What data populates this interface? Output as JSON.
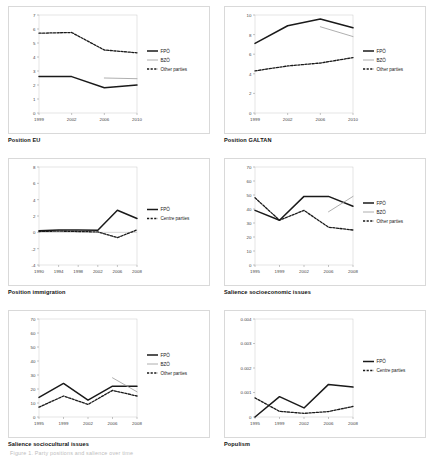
{
  "figure": {
    "footer_note": "Figure 1. Party positions and salience over time",
    "panel_layout": "2 columns × 3 rows"
  },
  "legend_labels": {
    "fpo": "FPÖ",
    "bzo": "BZÖ",
    "other": "Other parties",
    "centre": "Centre parties"
  },
  "captions": [
    "Position EU",
    "Position GALTAN",
    "Position immigration",
    "Salience socioeconomic issues",
    "Salience sociocultural issues",
    "Populism"
  ],
  "chart_data": [
    {
      "type": "line",
      "title": "Position EU",
      "xlabel": "",
      "ylabel": "",
      "x": [
        1999,
        2002,
        2006,
        2010
      ],
      "xtick_labels": [
        "1999",
        "2002",
        "2006",
        "2010"
      ],
      "ylim": [
        0,
        7
      ],
      "ytick_labels": [
        "0",
        "1",
        "2",
        "3",
        "4",
        "5",
        "6",
        "7"
      ],
      "grid": false,
      "legend_position": "right",
      "series": [
        {
          "name": "FPÖ",
          "style": "solid-thick",
          "color": "#1a1a1a",
          "x": [
            1999,
            2002,
            2006,
            2010
          ],
          "values": [
            2.6,
            2.6,
            1.8,
            2.0
          ]
        },
        {
          "name": "BZÖ",
          "style": "solid-thin",
          "color": "#9a9a9a",
          "x": [
            2006,
            2010
          ],
          "values": [
            2.5,
            2.45
          ]
        },
        {
          "name": "Other parties",
          "style": "dashed",
          "color": "#1a1a1a",
          "x": [
            1999,
            2002,
            2006,
            2010
          ],
          "values": [
            5.7,
            5.75,
            4.5,
            4.3
          ]
        }
      ]
    },
    {
      "type": "line",
      "title": "Position GALTAN",
      "xlabel": "",
      "ylabel": "",
      "x": [
        1999,
        2002,
        2006,
        2010
      ],
      "xtick_labels": [
        "1999",
        "2002",
        "2006",
        "2010"
      ],
      "ylim": [
        0,
        10
      ],
      "ytick_labels": [
        "0",
        "2",
        "4",
        "6",
        "8",
        "10"
      ],
      "grid": false,
      "legend_position": "right",
      "series": [
        {
          "name": "FPÖ",
          "style": "solid-thick",
          "color": "#1a1a1a",
          "x": [
            1999,
            2002,
            2006,
            2010
          ],
          "values": [
            7.1,
            8.9,
            9.6,
            8.7
          ]
        },
        {
          "name": "BZÖ",
          "style": "solid-thin",
          "color": "#9a9a9a",
          "x": [
            2006,
            2010
          ],
          "values": [
            8.8,
            7.8
          ]
        },
        {
          "name": "Other parties",
          "style": "dashed",
          "color": "#1a1a1a",
          "x": [
            1999,
            2002,
            2006,
            2010
          ],
          "values": [
            4.3,
            4.8,
            5.1,
            5.65
          ]
        }
      ]
    },
    {
      "type": "line",
      "title": "Position immigration",
      "xlabel": "",
      "ylabel": "",
      "x": [
        1990,
        1994,
        1998,
        2002,
        2006,
        2008
      ],
      "xtick_labels": [
        "1990",
        "1994",
        "1998",
        "2002",
        "2006",
        "2008"
      ],
      "ylim": [
        -4,
        8
      ],
      "ytick_labels": [
        "-4",
        "-2",
        "0",
        "2",
        "4",
        "6",
        "8"
      ],
      "grid": false,
      "legend_position": "right",
      "series": [
        {
          "name": "FPÖ",
          "style": "solid-thick",
          "color": "#1a1a1a",
          "x": [
            1990,
            1994,
            1998,
            2002,
            2006,
            2008
          ],
          "values": [
            0.2,
            0.3,
            0.3,
            0.25,
            2.7,
            1.7
          ]
        },
        {
          "name": "Centre parties",
          "style": "dashed",
          "color": "#1a1a1a",
          "x": [
            1990,
            1994,
            1998,
            2002,
            2006,
            2008
          ],
          "values": [
            0.1,
            0.15,
            0.1,
            0.05,
            -0.65,
            0.3
          ]
        }
      ]
    },
    {
      "type": "line",
      "title": "Salience socioeconomic issues",
      "xlabel": "",
      "ylabel": "",
      "x": [
        1995,
        1999,
        2002,
        2006,
        2008
      ],
      "xtick_labels": [
        "1995",
        "1999",
        "2002",
        "2006",
        "2008"
      ],
      "ylim": [
        0,
        70
      ],
      "ytick_labels": [
        "0",
        "10",
        "20",
        "30",
        "40",
        "50",
        "60",
        "70"
      ],
      "grid": false,
      "legend_position": "right",
      "series": [
        {
          "name": "FPÖ",
          "style": "solid-thick",
          "color": "#1a1a1a",
          "x": [
            1995,
            1999,
            2002,
            2006,
            2008
          ],
          "values": [
            39,
            32,
            49,
            49,
            42
          ]
        },
        {
          "name": "BZÖ",
          "style": "solid-thin",
          "color": "#9a9a9a",
          "x": [
            2006,
            2008
          ],
          "values": [
            38,
            49
          ]
        },
        {
          "name": "Other parties",
          "style": "dashed",
          "color": "#1a1a1a",
          "x": [
            1995,
            1999,
            2002,
            2006,
            2008
          ],
          "values": [
            48,
            32,
            39,
            27,
            25
          ]
        }
      ]
    },
    {
      "type": "line",
      "title": "Salience sociocultural issues",
      "xlabel": "",
      "ylabel": "",
      "x": [
        1995,
        1999,
        2002,
        2006,
        2008
      ],
      "xtick_labels": [
        "1995",
        "1999",
        "2002",
        "2006",
        "2008"
      ],
      "ylim": [
        0,
        70
      ],
      "ytick_labels": [
        "0",
        "10",
        "20",
        "30",
        "40",
        "50",
        "60",
        "70"
      ],
      "grid": false,
      "legend_position": "right",
      "series": [
        {
          "name": "FPÖ",
          "style": "solid-thick",
          "color": "#1a1a1a",
          "x": [
            1995,
            1999,
            2002,
            2006,
            2008
          ],
          "values": [
            14,
            24,
            12,
            22,
            22
          ]
        },
        {
          "name": "BZÖ",
          "style": "solid-thin",
          "color": "#9a9a9a",
          "x": [
            2006,
            2008
          ],
          "values": [
            28,
            18
          ]
        },
        {
          "name": "Other parties",
          "style": "dashed",
          "color": "#1a1a1a",
          "x": [
            1995,
            1999,
            2002,
            2006,
            2008
          ],
          "values": [
            7,
            15,
            9,
            19,
            15
          ]
        }
      ]
    },
    {
      "type": "line",
      "title": "Populism",
      "xlabel": "",
      "ylabel": "",
      "x": [
        1995,
        1999,
        2002,
        2006,
        2008
      ],
      "xtick_labels": [
        "1995",
        "1999",
        "2002",
        "2006",
        "2008"
      ],
      "ylim": [
        0,
        0.004
      ],
      "ytick_labels": [
        "0",
        "0.001",
        "0.002",
        "0.003",
        "0.004"
      ],
      "grid": false,
      "legend_position": "right",
      "series": [
        {
          "name": "FPÖ",
          "style": "solid-thick",
          "color": "#1a1a1a",
          "x": [
            1995,
            1999,
            2002,
            2006,
            2008
          ],
          "values": [
            0.0,
            0.00083,
            0.00037,
            0.00133,
            0.00122
          ]
        },
        {
          "name": "Centre parties",
          "style": "dashed",
          "color": "#1a1a1a",
          "x": [
            1995,
            1999,
            2002,
            2006,
            2008
          ],
          "values": [
            0.00078,
            0.00023,
            0.00015,
            0.00022,
            0.00043
          ]
        }
      ]
    }
  ]
}
